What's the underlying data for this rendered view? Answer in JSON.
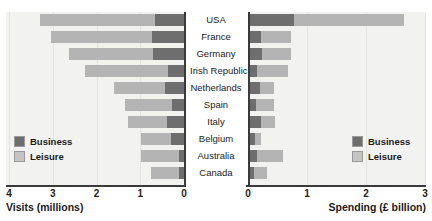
{
  "chart_data": {
    "type": "bar",
    "orientation": "horizontal",
    "stacked": true,
    "title": "",
    "categories": [
      "USA",
      "France",
      "Germany",
      "Irish Republic",
      "Netherlands",
      "Spain",
      "Italy",
      "Belgium",
      "Australia",
      "Canada"
    ],
    "panels": [
      {
        "name": "visits",
        "xlabel": "Visits (millions)",
        "ylabel": "",
        "xlim": [
          0,
          4
        ],
        "reversed": true,
        "ticks": [
          4,
          3,
          2,
          1,
          0
        ],
        "tick_labels": [
          "4",
          "3",
          "2",
          "1",
          "0"
        ],
        "grid": true,
        "legend_position": "bottom-left",
        "series": [
          {
            "name": "Business",
            "color": "#6e6e6e",
            "values": [
              0.66,
              0.74,
              0.72,
              0.36,
              0.44,
              0.28,
              0.4,
              0.3,
              0.12,
              0.12
            ]
          },
          {
            "name": "Leisure",
            "color": "#b4b4b4",
            "values": [
              2.64,
              2.3,
              1.9,
              1.9,
              1.16,
              1.08,
              0.88,
              0.68,
              0.86,
              0.64
            ]
          }
        ],
        "totals": [
          3.3,
          3.04,
          2.62,
          2.26,
          1.6,
          1.36,
          1.28,
          0.98,
          0.98,
          0.76
        ]
      },
      {
        "name": "spending",
        "xlabel": "Spending (£ billion)",
        "ylabel": "",
        "xlim": [
          0,
          3
        ],
        "reversed": false,
        "ticks": [
          0,
          1,
          2,
          3
        ],
        "tick_labels": [
          "0",
          "1",
          "2",
          "3"
        ],
        "grid": true,
        "legend_position": "bottom-right",
        "series": [
          {
            "name": "Business",
            "color": "#6e6e6e",
            "values": [
              0.78,
              0.22,
              0.24,
              0.16,
              0.2,
              0.14,
              0.22,
              0.12,
              0.16,
              0.1
            ]
          },
          {
            "name": "Leisure",
            "color": "#b4b4b4",
            "values": [
              1.87,
              0.51,
              0.49,
              0.52,
              0.24,
              0.3,
              0.24,
              0.1,
              0.43,
              0.22
            ]
          }
        ],
        "totals": [
          2.65,
          0.73,
          0.73,
          0.68,
          0.44,
          0.44,
          0.46,
          0.22,
          0.59,
          0.32
        ]
      }
    ],
    "legend": {
      "entries": [
        {
          "label": "Business",
          "color": "#6e6e6e"
        },
        {
          "label": "Leisure",
          "color": "#c4c4c4"
        }
      ]
    },
    "colors": {
      "business": "#6e6e6e",
      "leisure": "#b4b4b4",
      "plot_background": "#f2f2f0",
      "gridline": "#e3e3e0",
      "axis": "#3a3a3a",
      "text": "#1c1c1c"
    }
  }
}
